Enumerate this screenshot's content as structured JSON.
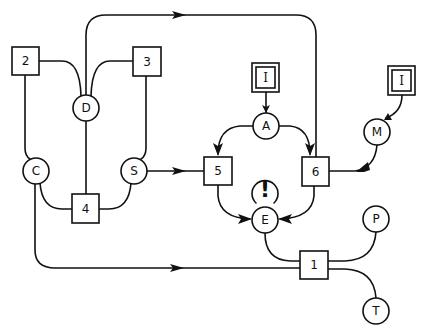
{
  "diagram": {
    "type": "flow-graph",
    "background": "#ffffff",
    "stroke_color": "#111111",
    "nodes": {
      "box_1": {
        "label": "1",
        "shape": "square"
      },
      "box_2": {
        "label": "2",
        "shape": "square"
      },
      "box_3": {
        "label": "3",
        "shape": "square"
      },
      "box_4": {
        "label": "4",
        "shape": "square"
      },
      "box_5": {
        "label": "5",
        "shape": "square"
      },
      "box_6": {
        "label": "6",
        "shape": "square"
      },
      "input_top": {
        "label": "I",
        "shape": "double-square"
      },
      "input_right": {
        "label": "I",
        "shape": "double-square"
      },
      "circle_A": {
        "label": "A",
        "shape": "circle"
      },
      "circle_C": {
        "label": "C",
        "shape": "circle"
      },
      "circle_D": {
        "label": "D",
        "shape": "circle"
      },
      "circle_E": {
        "label": "E",
        "shape": "circle"
      },
      "circle_M": {
        "label": "M",
        "shape": "circle"
      },
      "circle_P": {
        "label": "P",
        "shape": "circle"
      },
      "circle_S": {
        "label": "S",
        "shape": "circle"
      },
      "circle_T": {
        "label": "T",
        "shape": "circle"
      },
      "alert": {
        "label": "!",
        "shape": "alert-marker"
      }
    },
    "edges": [
      {
        "from": "box_2",
        "to": "circle_D",
        "directed": false
      },
      {
        "from": "box_3",
        "to": "circle_D",
        "directed": false
      },
      {
        "from": "circle_D",
        "to": "box_6",
        "directed": true,
        "route": "top-loop"
      },
      {
        "from": "circle_D",
        "to": "box_4",
        "directed": false
      },
      {
        "from": "box_2",
        "to": "circle_C",
        "directed": false
      },
      {
        "from": "box_3",
        "to": "circle_S",
        "directed": false
      },
      {
        "from": "circle_C",
        "to": "box_4",
        "directed": false
      },
      {
        "from": "circle_S",
        "to": "box_4",
        "directed": false
      },
      {
        "from": "circle_S",
        "to": "box_5",
        "directed": true
      },
      {
        "from": "input_top",
        "to": "circle_A",
        "directed": true
      },
      {
        "from": "circle_A",
        "to": "box_5",
        "directed": true
      },
      {
        "from": "circle_A",
        "to": "box_6",
        "directed": true
      },
      {
        "from": "input_right",
        "to": "circle_M",
        "directed": true
      },
      {
        "from": "circle_M",
        "to": "box_6",
        "directed": true
      },
      {
        "from": "box_5",
        "to": "circle_E",
        "directed": true
      },
      {
        "from": "box_6",
        "to": "circle_E",
        "directed": true
      },
      {
        "from": "circle_E",
        "to": "box_1",
        "directed": false
      },
      {
        "from": "circle_C",
        "to": "box_1",
        "directed": true
      },
      {
        "from": "box_1",
        "to": "circle_P",
        "directed": false
      },
      {
        "from": "box_1",
        "to": "circle_T",
        "directed": false
      }
    ]
  }
}
